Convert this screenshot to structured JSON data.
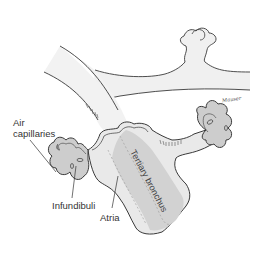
{
  "diagram": {
    "labels": {
      "air_capillaries_line1": "Air",
      "air_capillaries_line2": "capillaries",
      "infundibuli": "Infundibuli",
      "atria": "Atria",
      "tertiary_bronchus": "Tertiary bronchus"
    },
    "signature": "Mauser",
    "colors": {
      "outline": "#3a3a3a",
      "tube_fill": "#efefef",
      "bronchus_fill": "#d8d8d8",
      "bronchus_shade": "#bdbdbd",
      "infundibulum_fill": "#cfcfcf",
      "background": "#ffffff",
      "label_text": "#333333"
    }
  }
}
